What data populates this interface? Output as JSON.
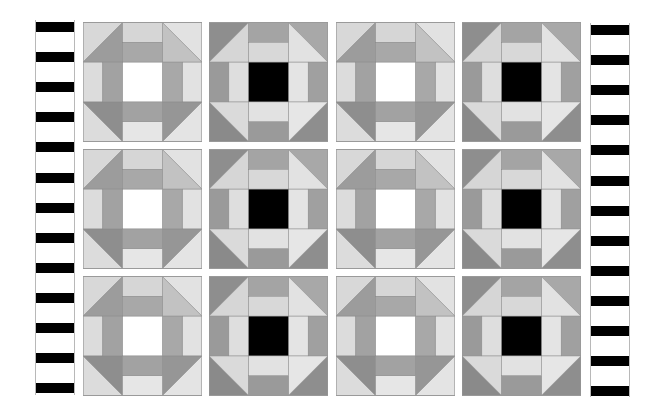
{
  "quilt": {
    "title": "",
    "layout": {
      "rows": 3,
      "cols": 4,
      "pattern": "alternating churn-dash blocks"
    },
    "block_types": {
      "A": {
        "center": "#ffffff",
        "tl": [
          "#d8d8d8",
          "#9c9c9c"
        ],
        "tr": [
          "#e2e2e2",
          "#c2c2c2"
        ],
        "bl": [
          "#dcdcdc",
          "#8e8e8e"
        ],
        "br": [
          "#e4e4e4",
          "#969696"
        ],
        "top": [
          "#d6d6d6",
          "#a8a8a8"
        ],
        "left": [
          "#dcdcdc",
          "#a2a2a2"
        ],
        "right": [
          "#e2e2e2",
          "#a8a8a8"
        ],
        "bottom": [
          "#e6e6e6",
          "#a2a2a2"
        ]
      },
      "B": {
        "center": "#000000",
        "tl": [
          "#8e8e8e",
          "#d6d6d6"
        ],
        "tr": [
          "#a8a8a8",
          "#e2e2e2"
        ],
        "bl": [
          "#8a8a8a",
          "#dadada"
        ],
        "br": [
          "#8e8e8e",
          "#e6e6e6"
        ],
        "top": [
          "#a4a4a4",
          "#d8d8d8"
        ],
        "left": [
          "#9a9a9a",
          "#dedede"
        ],
        "right": [
          "#a0a0a0",
          "#e4e4e4"
        ],
        "bottom": [
          "#9a9a9a",
          "#e2e2e2"
        ]
      }
    },
    "grid": [
      [
        "A",
        "B",
        "A",
        "B"
      ],
      [
        "A",
        "B",
        "A",
        "B"
      ],
      [
        "A",
        "B",
        "A",
        "B"
      ]
    ],
    "side_strips": {
      "left": {
        "bars": 13,
        "bar_color": "#000000",
        "background": "#ffffff"
      },
      "right": {
        "bars": 13,
        "bar_color": "#000000",
        "background": "#ffffff"
      }
    }
  }
}
